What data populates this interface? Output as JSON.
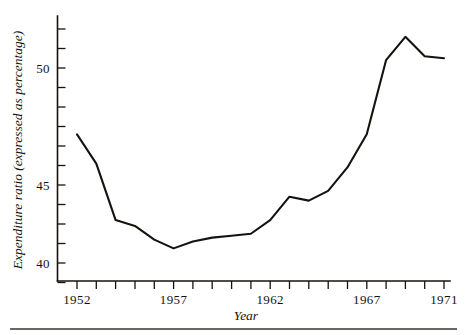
{
  "figure": {
    "background_color": "#ffffff",
    "ink_color": "#16120f",
    "cropped_title": "",
    "bottom_rule_present": "yes"
  },
  "axes": {
    "x_title": "Year",
    "y_title": "Expenditure ratio (expressed as percentage)",
    "x_tick_labels": [
      "1952",
      "1957",
      "1962",
      "1967",
      "1971"
    ],
    "y_tick_labels": [
      "40",
      "45",
      "50"
    ]
  },
  "chart_data": {
    "type": "line",
    "title": "",
    "xlabel": "Year",
    "ylabel": "Expenditure ratio (expressed as percentage)",
    "x": [
      1952,
      1953,
      1954,
      1955,
      1956,
      1957,
      1958,
      1959,
      1960,
      1961,
      1962,
      1963,
      1964,
      1965,
      1966,
      1967,
      1968,
      1969,
      1970,
      1971
    ],
    "values": [
      46.6,
      45.1,
      42.2,
      41.9,
      41.2,
      40.75,
      41.1,
      41.3,
      41.4,
      41.5,
      42.2,
      43.4,
      43.2,
      43.7,
      44.9,
      46.6,
      50.4,
      51.6,
      50.6,
      50.5
    ],
    "series": [
      {
        "name": "Expenditure ratio",
        "values": [
          46.6,
          45.1,
          42.2,
          41.9,
          41.2,
          40.75,
          41.1,
          41.3,
          41.4,
          41.5,
          42.2,
          43.4,
          43.2,
          43.7,
          44.9,
          46.6,
          50.4,
          51.6,
          50.6,
          50.5
        ]
      }
    ],
    "xlim": [
      1952,
      1971
    ],
    "ylim": [
      38.9,
      52.2
    ],
    "x_ticks": [
      1952,
      1953,
      1954,
      1955,
      1956,
      1957,
      1958,
      1959,
      1960,
      1961,
      1962,
      1963,
      1964,
      1965,
      1966,
      1967,
      1968,
      1969,
      1970,
      1971
    ],
    "x_tick_labels_shown": [
      "1952",
      "1957",
      "1962",
      "1967",
      "1971"
    ],
    "y_ticks": [
      39,
      40,
      41,
      42,
      43,
      44,
      45,
      46,
      47,
      48,
      49,
      50,
      51,
      52
    ],
    "y_tick_labels_shown": [
      "40",
      "45",
      "50"
    ],
    "grid": false,
    "legend": "none",
    "line_color": "#16120f"
  }
}
